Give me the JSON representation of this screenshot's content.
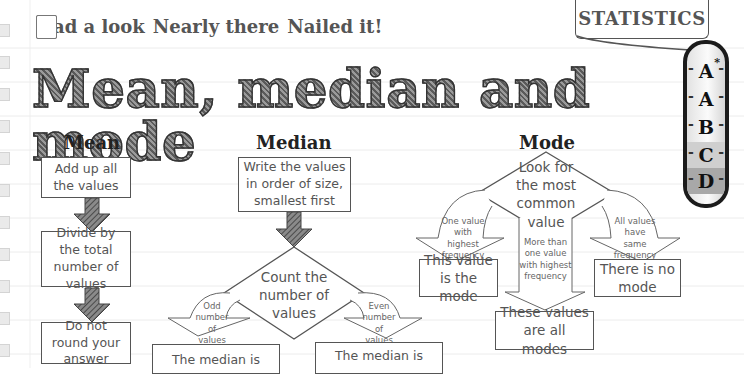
{
  "progress": {
    "items": [
      {
        "label": "Had a look",
        "checked": false
      },
      {
        "label": "Nearly there",
        "checked": false
      },
      {
        "label": "Nailed it!",
        "checked": false
      }
    ]
  },
  "topic_tag": "STATISTICS",
  "title": "Mean, median and mode",
  "grades": [
    {
      "letter": "A",
      "star": "*"
    },
    {
      "letter": "A",
      "star": ""
    },
    {
      "letter": "B",
      "star": ""
    },
    {
      "letter": "C",
      "star": ""
    },
    {
      "letter": "D",
      "star": ""
    }
  ],
  "grade_colors": {
    "C": "#c9c9c9",
    "D": "#a5a5a5"
  },
  "mean": {
    "heading": "Mean",
    "steps": [
      "Add up all the values",
      "Divide by the total number of values",
      "Do not round your answer"
    ]
  },
  "median": {
    "heading": "Median",
    "step1": "Write the values in order of size, smallest first",
    "decision": "Count the number of values",
    "odd_label": "Odd number of values",
    "even_label": "Even number of values",
    "odd_result": "The median is",
    "even_result": "The median is"
  },
  "mode": {
    "heading": "Mode",
    "decision": "Look for the most common value",
    "branch_one": "One value with highest frequency",
    "branch_many": "More than one value with highest frequency",
    "branch_all": "All values have same frequency",
    "result_one": "This value is the mode",
    "result_many": "These values are all modes",
    "result_all": "There is no mode"
  }
}
